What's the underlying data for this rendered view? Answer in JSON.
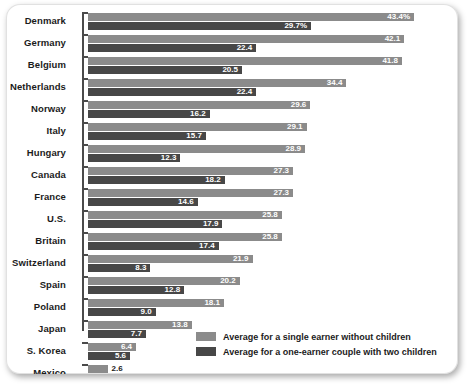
{
  "chart_data": {
    "type": "bar",
    "orientation": "horizontal",
    "title": "",
    "xlabel": "",
    "ylabel": "",
    "xlim": [
      0,
      46
    ],
    "grid": false,
    "legend_position": "bottom-right",
    "categories": [
      "Denmark",
      "Germany",
      "Belgium",
      "Netherlands",
      "Norway",
      "Italy",
      "Hungary",
      "Canada",
      "France",
      "U.S.",
      "Britain",
      "Switzerland",
      "Spain",
      "Poland",
      "Japan",
      "S. Korea",
      "Mexico"
    ],
    "series": [
      {
        "name": "Average for a single earner without children",
        "color": "#8b8b8b",
        "values": [
          43.4,
          42.1,
          41.8,
          34.4,
          29.6,
          29.1,
          28.9,
          27.3,
          27.3,
          25.8,
          25.8,
          21.9,
          20.2,
          18.1,
          13.8,
          6.4,
          2.6
        ],
        "labels": [
          "43.4%",
          "42.1",
          "41.8",
          "34.4",
          "29.6",
          "29.1",
          "28.9",
          "27.3",
          "27.3",
          "25.8",
          "25.8",
          "21.9",
          "20.2",
          "18.1",
          "13.8",
          "6.4",
          "2.6"
        ]
      },
      {
        "name": "Average for a one-earner couple with two children",
        "color": "#474747",
        "values": [
          29.7,
          22.4,
          20.5,
          22.4,
          16.2,
          15.7,
          12.3,
          18.2,
          14.6,
          17.9,
          17.4,
          8.3,
          12.8,
          9.0,
          7.7,
          5.6,
          2.6
        ],
        "labels": [
          "29.7%",
          "22.4",
          "20.5",
          "22.4",
          "16.2",
          "15.7",
          "12.3",
          "18.2",
          "14.6",
          "17.9",
          "17.4",
          "8.3",
          "12.8",
          "9.0",
          "7.7",
          "5.6",
          "2.6"
        ]
      }
    ]
  },
  "legend": {
    "items": [
      {
        "label": "Average for a single earner without children",
        "color": "#8b8b8b"
      },
      {
        "label": "Average for a one-earner couple with two children",
        "color": "#474747"
      }
    ]
  }
}
